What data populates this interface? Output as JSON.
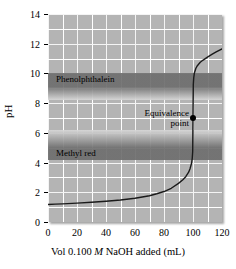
{
  "chart_data": {
    "type": "line",
    "title": "",
    "xlabel_parts": {
      "pre": "Vol 0.100 ",
      "italic": "M",
      "post": " NaOH added (mL)"
    },
    "xlabel": "Vol 0.100 M NaOH added (mL)",
    "ylabel": "pH",
    "xlim": [
      0,
      120
    ],
    "ylim": [
      0,
      14
    ],
    "xticks": [
      0,
      20,
      40,
      60,
      80,
      100,
      120
    ],
    "yticks": [
      0,
      2,
      4,
      6,
      8,
      10,
      12,
      14
    ],
    "grid": true,
    "grid_x_minor_step": 10,
    "grid_y_minor_step": 1,
    "legend": "none",
    "series": [
      {
        "name": "Titration curve",
        "x": [
          0,
          5,
          10,
          20,
          30,
          40,
          50,
          60,
          70,
          75,
          80,
          85,
          90,
          93,
          95,
          97,
          98,
          99,
          99.5,
          99.8,
          100,
          100.2,
          100.5,
          101,
          102,
          103,
          105,
          107,
          110,
          113,
          116,
          120
        ],
        "y": [
          1.18,
          1.2,
          1.22,
          1.27,
          1.33,
          1.4,
          1.48,
          1.6,
          1.77,
          1.9,
          2.05,
          2.27,
          2.6,
          2.85,
          3.05,
          3.35,
          3.6,
          3.95,
          4.3,
          4.75,
          7.0,
          9.25,
          9.7,
          10.05,
          10.35,
          10.52,
          10.75,
          10.9,
          11.1,
          11.28,
          11.45,
          11.65
        ]
      }
    ],
    "annotations": [
      {
        "name": "equivalence-point",
        "line1": "Equivalence",
        "line2": "point",
        "x": 100,
        "y": 7.0
      }
    ],
    "indicator_bands": [
      {
        "name": "phenolphthalein",
        "label": "Phenolphthalein",
        "ph_low": 8.2,
        "ph_high": 10.0,
        "core_low": 9.1,
        "core_high": 10.0
      },
      {
        "name": "methyl-red",
        "label": "Methyl red",
        "ph_low": 4.2,
        "ph_high": 6.2,
        "core_low": 4.2,
        "core_high": 5.0
      }
    ],
    "colors": {
      "plot_background": "#b4b4b4",
      "gridline": "#ffffff",
      "curve": "#1a1a1a",
      "band_dark": "#6e6e6e",
      "band_light": "#d8d8d8",
      "text": "#000000",
      "page_background": "#ffffff"
    }
  }
}
